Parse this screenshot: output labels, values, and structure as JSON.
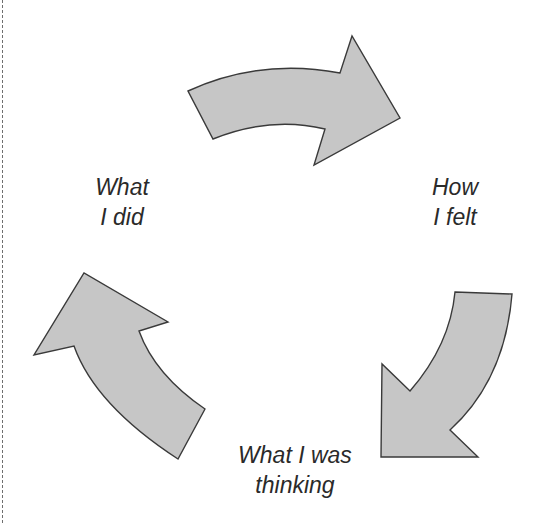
{
  "diagram": {
    "type": "cycle",
    "nodes": [
      {
        "id": "did",
        "lines": [
          "What",
          "I did"
        ]
      },
      {
        "id": "felt",
        "lines": [
          "How",
          "I felt"
        ]
      },
      {
        "id": "thinking",
        "lines": [
          "What I was",
          "thinking"
        ]
      }
    ],
    "arrows": [
      {
        "from": "did",
        "to": "felt",
        "direction": "clockwise"
      },
      {
        "from": "felt",
        "to": "thinking",
        "direction": "clockwise"
      },
      {
        "from": "thinking",
        "to": "did",
        "direction": "clockwise"
      }
    ],
    "colors": {
      "arrow_fill": "#c6c6c6",
      "arrow_stroke": "#3a3a3a",
      "text": "#2a2a2a",
      "dashed_border": "#6e6e6e"
    }
  }
}
